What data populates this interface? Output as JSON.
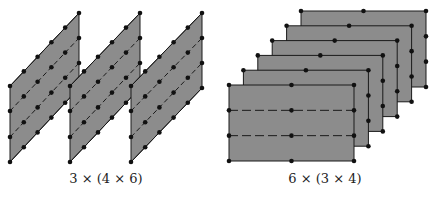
{
  "diagram": {
    "left": {
      "label": "3 × (4 × 6)",
      "panel_count": 3,
      "rows": 4,
      "cols": 6,
      "panels": [
        {
          "left_x": 10,
          "right_x": 79
        },
        {
          "left_x": 70,
          "right_x": 140
        },
        {
          "left_x": 131,
          "right_x": 202
        }
      ],
      "left_edge_y": [
        86,
        111,
        137,
        162
      ],
      "right_edge_y": [
        13,
        38,
        63,
        88
      ]
    },
    "right": {
      "label": "6 × (3 × 4)",
      "panel_count": 6,
      "front": {
        "x": 13,
        "y": 85,
        "w": 125,
        "h": 76
      },
      "offset": {
        "dx": 14.4,
        "dy": -14.8
      }
    },
    "colors": {
      "fill": "#8c8c8c",
      "stroke": "#1a1a1a",
      "dot": "#111111"
    }
  }
}
